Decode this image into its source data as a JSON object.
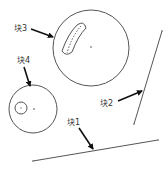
{
  "diagram": {
    "title": "",
    "colors": {
      "geometry": "#555555",
      "arrow": "#111111",
      "label": "#333333",
      "background": "#ffffff"
    },
    "labels": [
      {
        "id": "block3",
        "text": "块3",
        "x": 14,
        "y": 31
      },
      {
        "id": "block4",
        "text": "块4",
        "x": 17,
        "y": 63
      },
      {
        "id": "block2",
        "text": "块2",
        "x": 100,
        "y": 106
      },
      {
        "id": "block1",
        "text": "块1",
        "x": 67,
        "y": 125
      }
    ],
    "shapes": {
      "big_circle": {
        "cx": 91,
        "cy": 48,
        "r": 38
      },
      "small_circle": {
        "cx": 33,
        "cy": 109,
        "r": 24
      },
      "small_inner_circle": {
        "cx": 21,
        "cy": 108,
        "r": 6
      },
      "line_block2": {
        "x1": 162,
        "y1": 31,
        "x2": 134,
        "y2": 124
      },
      "line_block1": {
        "x1": 33,
        "y1": 161,
        "x2": 158,
        "y2": 140
      }
    }
  }
}
